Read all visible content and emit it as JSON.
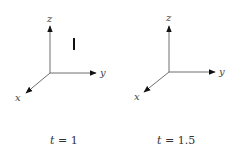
{
  "panels": [
    {
      "id": "panel-1",
      "axes": {
        "x": "x",
        "y": "y",
        "z": "z"
      },
      "caption": {
        "var": "t",
        "eq": " = ",
        "value": "1"
      },
      "marker": "vertical bar"
    },
    {
      "id": "panel-2",
      "axes": {
        "x": "x",
        "y": "y",
        "z": "z"
      },
      "caption": {
        "var": "t",
        "eq": " = ",
        "value": "1.5"
      }
    }
  ],
  "colors": {
    "axis": "#6e6e6e",
    "arrowhead": "#111111",
    "bar": "#111111"
  }
}
